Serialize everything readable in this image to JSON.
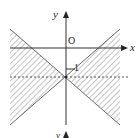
{
  "figure": {
    "axes": {
      "x_label": "x",
      "y_label": "y",
      "origin_label": "O",
      "tick_label": "-1",
      "tick_label_short": "1",
      "bottom_cut_label": "y"
    },
    "regions": {
      "description": "Hatched double-wedge region between lines y = x - 1 and y = -x - 1, split by dashed line y = -1",
      "hatch_color": "#8a8a8a",
      "line_color": "#6a6a6a",
      "axis_color": "#333333"
    },
    "dashed_line": "y = -1"
  }
}
